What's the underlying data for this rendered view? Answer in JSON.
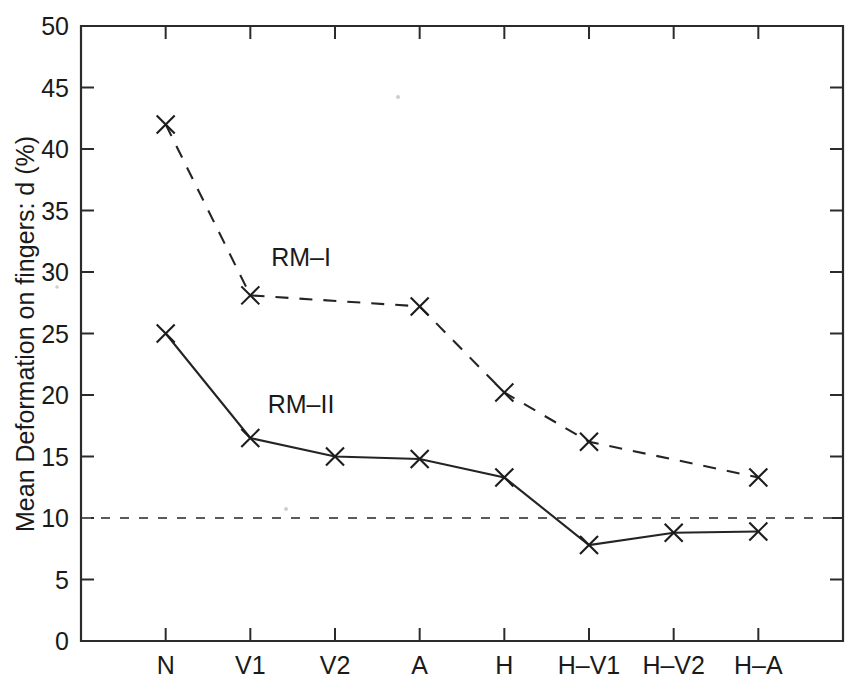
{
  "chart_data": {
    "type": "line",
    "title": "",
    "xlabel": "",
    "ylabel": "Mean Deformation on fingers: d (%)",
    "categories": [
      "N",
      "V1",
      "V2",
      "A",
      "H",
      "H-V1",
      "H-V2",
      "H-A"
    ],
    "ylim": [
      0,
      50
    ],
    "yticks": [
      0,
      5,
      10,
      15,
      20,
      25,
      30,
      35,
      40,
      45,
      50
    ],
    "ytick_labels": [
      "0",
      "5",
      "10",
      "15",
      "20",
      "25",
      "30",
      "35",
      "40",
      "45",
      "50"
    ],
    "grid": false,
    "legend_position": "inline-annotation",
    "series": [
      {
        "name": "RM-I",
        "style": "dashed",
        "marker": "x",
        "label_x_category": "V2",
        "label_value": 30.5,
        "values": [
          42.0,
          28.1,
          null,
          27.2,
          20.2,
          16.2,
          null,
          13.3
        ]
      },
      {
        "name": "RM-II",
        "style": "solid",
        "marker": "x",
        "label_x_category": "V2",
        "label_value": 18.5,
        "values": [
          25.0,
          16.5,
          15.0,
          14.8,
          13.3,
          7.8,
          8.8,
          8.9
        ]
      }
    ],
    "reference_lines": [
      {
        "name": "threshold",
        "orientation": "horizontal",
        "value": 10,
        "style": "dashed"
      }
    ],
    "annotations": [
      {
        "text": "RM-I",
        "value": 30.5
      },
      {
        "text": "RM-II",
        "value": 18.5
      }
    ]
  },
  "colors": {
    "axis": "#2b2b2b",
    "series": "#242424",
    "reference": "#5a5a5a",
    "background": "#ffffff"
  }
}
